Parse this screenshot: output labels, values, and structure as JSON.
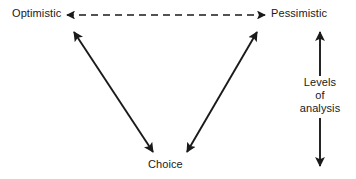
{
  "diagram": {
    "type": "relationship-diagram",
    "width": 356,
    "height": 179,
    "background_color": "#ffffff",
    "stroke_color": "#1a1a1a",
    "text_color": "#1a1a1a",
    "nodes": {
      "optimistic": "Optimistic",
      "pessimistic": "Pessimistic",
      "choice": "Choice"
    },
    "axis": {
      "line1": "Levels",
      "line2": "of",
      "line3": "analysis"
    },
    "connectors": [
      {
        "name": "optimistic-pessimistic-dashed",
        "style": "dashed",
        "heads": "both",
        "from": "Optimistic",
        "to": "Pessimistic"
      },
      {
        "name": "optimistic-choice",
        "style": "solid",
        "heads": "both",
        "from": "Optimistic",
        "to": "Choice"
      },
      {
        "name": "pessimistic-choice",
        "style": "solid",
        "heads": "both",
        "from": "Pessimistic",
        "to": "Choice"
      },
      {
        "name": "levels-of-analysis-axis",
        "style": "solid",
        "heads": "both",
        "from": "Levels of analysis (top)",
        "to": "Levels of analysis (bottom)"
      }
    ]
  }
}
